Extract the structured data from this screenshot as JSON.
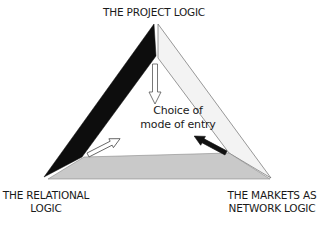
{
  "diagram": {
    "vertices": {
      "top": "THE PROJECT LOGIC",
      "bottom_left": [
        "THE RELATIONAL",
        "LOGIC"
      ],
      "bottom_right": [
        "THE MARKETS AS",
        "NETWORK LOGIC"
      ]
    },
    "center": [
      "Choice of",
      "mode of entry"
    ],
    "arrows": [
      {
        "from": "top",
        "to": "center",
        "style": "outline"
      },
      {
        "from": "bottom_left",
        "to": "center",
        "style": "outline"
      },
      {
        "from": "bottom_right",
        "to": "center",
        "style": "solid-black"
      }
    ],
    "sides": {
      "left": {
        "fill": "#0d0d0d"
      },
      "right": {
        "fill": "#f2f2f2"
      },
      "bottom": {
        "fill": "#c8c8c8"
      }
    }
  }
}
